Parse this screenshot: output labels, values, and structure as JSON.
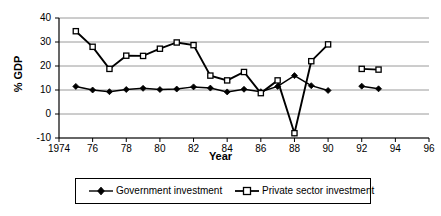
{
  "chart_data": {
    "type": "line",
    "title": "",
    "xlabel": "Year",
    "ylabel": "% GDP",
    "xlim": [
      1974,
      1996
    ],
    "ylim": [
      -10,
      40
    ],
    "xticks": [
      "1974",
      "76",
      "78",
      "80",
      "82",
      "84",
      "86",
      "88",
      "90",
      "92",
      "94",
      "96"
    ],
    "xtick_values": [
      1974,
      1976,
      1978,
      1980,
      1982,
      1984,
      1986,
      1988,
      1990,
      1992,
      1994,
      1996
    ],
    "yticks": [
      "40",
      "30",
      "20",
      "10",
      "0",
      "-10"
    ],
    "ytick_values": [
      40,
      30,
      20,
      10,
      0,
      -10
    ],
    "grid": "horizontal",
    "legend_position": "bottom",
    "series": [
      {
        "name": "Government investment",
        "marker": "filled-diamond",
        "color": "#000000",
        "x": [
          1975,
          1976,
          1977,
          1978,
          1979,
          1980,
          1981,
          1982,
          1983,
          1984,
          1985,
          1986,
          1987,
          1988,
          1989,
          1990
        ],
        "values": [
          11.5,
          10.0,
          9.3,
          10.2,
          10.7,
          10.2,
          10.4,
          11.3,
          10.8,
          9.2,
          10.3,
          9.3,
          11.5,
          16.0,
          11.8,
          9.8
        ]
      },
      {
        "name": "Government investment",
        "segment": 2,
        "marker": "filled-diamond",
        "color": "#000000",
        "x": [
          1992,
          1993
        ],
        "values": [
          11.6,
          10.5
        ]
      },
      {
        "name": "Private sector investment",
        "marker": "open-square",
        "color": "#000000",
        "x": [
          1975,
          1976,
          1977,
          1978,
          1979,
          1980,
          1981,
          1982,
          1983,
          1984,
          1985,
          1986,
          1987,
          1988,
          1989,
          1990
        ],
        "values": [
          34.5,
          28.0,
          18.8,
          24.3,
          24.2,
          27.2,
          29.8,
          28.7,
          16.0,
          14.0,
          17.5,
          8.7,
          14.0,
          -8.0,
          22.0,
          29.0
        ]
      },
      {
        "name": "Private sector investment",
        "segment": 2,
        "marker": "open-square",
        "color": "#000000",
        "x": [
          1992,
          1993
        ],
        "values": [
          18.8,
          18.5
        ]
      }
    ]
  },
  "legend": {
    "gov_label": "Government investment",
    "priv_label": "Private sector investment"
  },
  "axes": {
    "ylabel": "% GDP",
    "xlabel": "Year"
  }
}
